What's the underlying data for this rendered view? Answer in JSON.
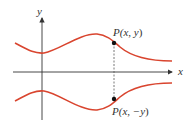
{
  "diagram": {
    "type": "graph-symmetry",
    "axes": {
      "x_label": "x",
      "y_label": "y"
    },
    "points": [
      {
        "label_prefix": "P(",
        "label_x": "x",
        "label_sep": ", ",
        "label_y": "y",
        "label_suffix": ")",
        "full": "P(x, y)"
      },
      {
        "label_prefix": "P(",
        "label_x": "x",
        "label_sep": ", ",
        "label_y": "−y",
        "label_suffix": ")",
        "full": "P(x, −y)"
      }
    ],
    "colors": {
      "curve": "#d9452f",
      "axis": "#333333",
      "dashed_line": "#555555",
      "point": "#111111"
    }
  }
}
